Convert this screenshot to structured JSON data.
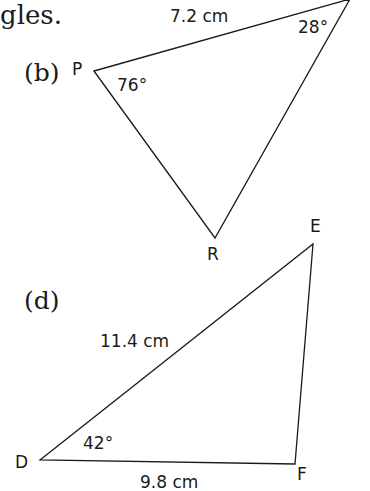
{
  "header_fragment": "gles.",
  "triangle_b": {
    "label": "(b)",
    "vertices": {
      "P": "P",
      "R": "R"
    },
    "side_length": "7.2 cm",
    "angles": {
      "P": "76°",
      "top": "28°"
    }
  },
  "triangle_d": {
    "label": "(d)",
    "vertices": {
      "D": "D",
      "E": "E",
      "F": "F"
    },
    "side_DE": "11.4 cm",
    "side_DF": "9.8 cm",
    "angle_D": "42°"
  },
  "colors": {
    "stroke": "#1a1a1a",
    "background": "#ffffff"
  }
}
